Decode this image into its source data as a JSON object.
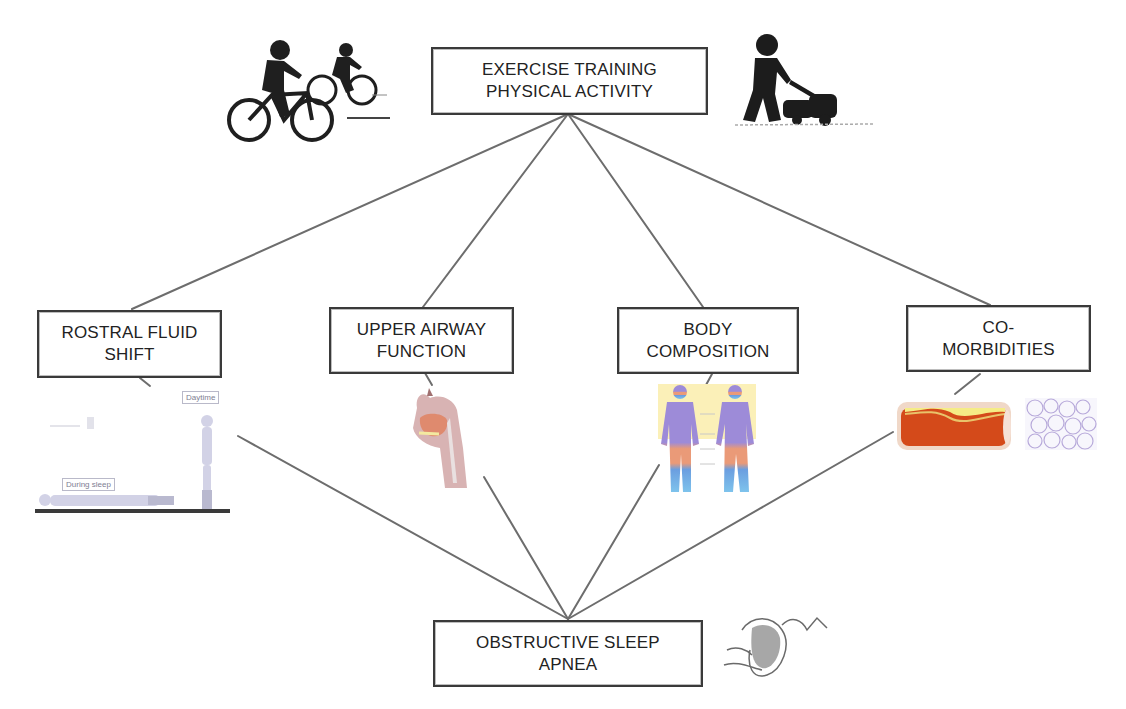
{
  "diagram": {
    "type": "network",
    "colors": {
      "line": "#6d6d6d",
      "box_border": "#3a3a3a",
      "text": "#222222",
      "background": "#ffffff"
    },
    "top_node": {
      "line1": "EXERCISE TRAINING",
      "line2": "PHYSICAL ACTIVITY"
    },
    "mediators": [
      {
        "line1": "ROSTRAL FLUID",
        "line2": "SHIFT"
      },
      {
        "line1": "UPPER AIRWAY",
        "line2": "FUNCTION"
      },
      {
        "line1": "BODY",
        "line2": "COMPOSITION"
      },
      {
        "line1": "CO-",
        "line2": "MORBIDITIES"
      }
    ],
    "bottom_node": {
      "line1": "OBSTRUCTIVE SLEEP",
      "line2": "APNEA"
    },
    "illustrations": {
      "cyclists": "cycling-icon",
      "mower": "lawn-mowing-icon",
      "fluid_shift": {
        "icon": "fluid-shift-figures",
        "label_day": "Daytime",
        "label_sleep": "During sleep"
      },
      "airway": "upper-airway-anatomy",
      "body": "body-composition-figures",
      "artery": "atherosclerotic-artery",
      "fat_tissue": "adipose-tissue",
      "osa": "collapsed-airway"
    },
    "edges": [
      {
        "from": "top_node",
        "to": "mediators.0"
      },
      {
        "from": "top_node",
        "to": "mediators.1"
      },
      {
        "from": "top_node",
        "to": "mediators.2"
      },
      {
        "from": "top_node",
        "to": "mediators.3"
      },
      {
        "from": "mediators.0",
        "to": "bottom_node"
      },
      {
        "from": "mediators.1",
        "to": "bottom_node"
      },
      {
        "from": "mediators.2",
        "to": "bottom_node"
      },
      {
        "from": "mediators.3",
        "to": "bottom_node"
      }
    ]
  }
}
